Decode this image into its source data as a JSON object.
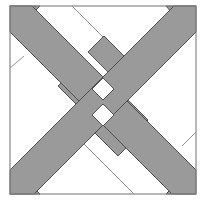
{
  "diagram": {
    "title": "",
    "colors": {
      "band_fill": "#9a9a9a",
      "background": "#ffffff",
      "outline": "#555555",
      "frame": "#888888",
      "thin_line": "#777777"
    }
  }
}
